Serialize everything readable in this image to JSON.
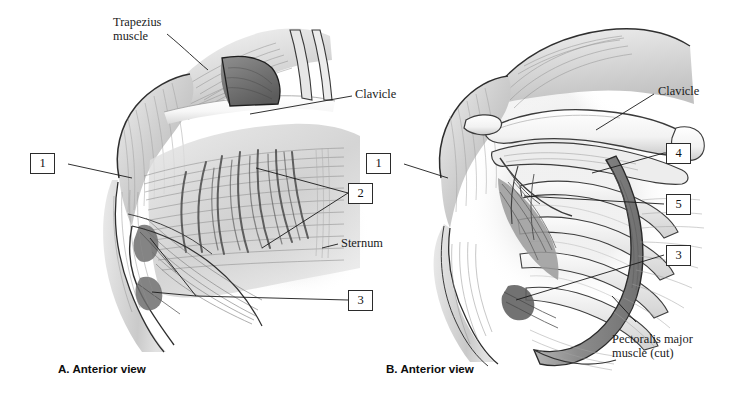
{
  "figure": {
    "background_color": "#ffffff",
    "ink_color": "#1a1a1a",
    "width": 738,
    "height": 398
  },
  "panels": [
    {
      "id": "A",
      "caption": "A. Anterior view",
      "description": "Superficial anterior view of shoulder and chest showing trapezius, deltoid, pectoralis major and sternum"
    },
    {
      "id": "B",
      "caption": "B. Anterior view",
      "description": "Deep anterior view with pectoralis major cut and reflected, exposing clavicle, ribs and deeper muscles"
    }
  ],
  "panel_a": {
    "caption": "A. Anterior view",
    "text_labels": [
      {
        "name": "trapezius-muscle-label",
        "text": "Trapezius\nmuscle"
      },
      {
        "name": "clavicle-label",
        "text": "Clavicle"
      },
      {
        "name": "sternum-label",
        "text": "Sternum"
      }
    ],
    "callouts": [
      {
        "name": "callout-1",
        "number": "1"
      },
      {
        "name": "callout-2",
        "number": "2"
      },
      {
        "name": "callout-3",
        "number": "3"
      }
    ]
  },
  "panel_b": {
    "caption": "B. Anterior view",
    "text_labels": [
      {
        "name": "clavicle-label",
        "text": "Clavicle"
      },
      {
        "name": "pectoralis-major-cut-label",
        "text": "Pectoralis major\nmuscle (cut)"
      }
    ],
    "callouts": [
      {
        "name": "callout-1",
        "number": "1"
      },
      {
        "name": "callout-4",
        "number": "4"
      },
      {
        "name": "callout-5",
        "number": "5"
      },
      {
        "name": "callout-3",
        "number": "3"
      }
    ]
  }
}
